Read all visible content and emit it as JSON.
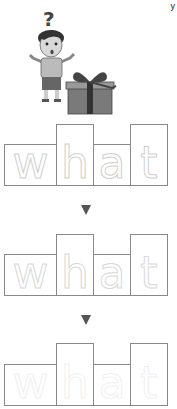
{
  "worksheet": {
    "word": "what",
    "letters": [
      "w",
      "h",
      "a",
      "t"
    ],
    "corner_mark": "y",
    "illustration": {
      "description": "confused boy with question mark next to a gift box",
      "question_mark": "?"
    },
    "rows": [
      {
        "style": "outline",
        "letters": [
          "w",
          "h",
          "a",
          "t"
        ]
      },
      {
        "style": "dotted",
        "letters": [
          "w",
          "h",
          "a",
          "t"
        ]
      },
      {
        "style": "faint",
        "letters": [
          "w",
          "h",
          "a",
          "t"
        ]
      }
    ],
    "arrows": [
      "down-arrow",
      "down-arrow"
    ],
    "colors": {
      "box_border": "#888888",
      "letter_outline": "#d0d0d0",
      "arrow": "#555555"
    }
  }
}
